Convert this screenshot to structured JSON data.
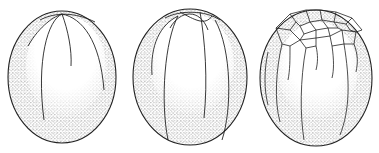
{
  "figure": {
    "background": "#ffffff",
    "ink": "#222222",
    "panels": [
      {
        "id": "stage-1",
        "label": "",
        "cx": 62,
        "cy": 76,
        "rx": 54,
        "ry": 66
      },
      {
        "id": "stage-2",
        "label": "",
        "cx": 190,
        "cy": 76,
        "rx": 57,
        "ry": 68
      },
      {
        "id": "stage-3",
        "label": "",
        "cx": 316,
        "cy": 76,
        "rx": 56,
        "ry": 68
      }
    ]
  }
}
